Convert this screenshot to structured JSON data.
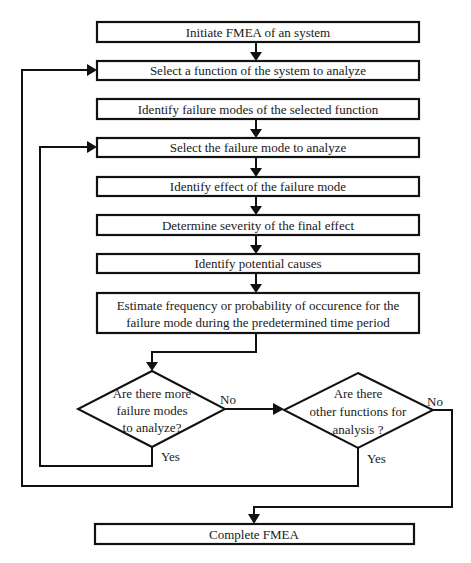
{
  "diagram": {
    "steps": [
      {
        "id": "initiate",
        "lines": [
          "Initiate FMEA of an system"
        ]
      },
      {
        "id": "select-function",
        "lines": [
          "Select a function of the system to analyze"
        ]
      },
      {
        "id": "identify-failure-modes",
        "lines": [
          "Identify failure modes of the selected function"
        ]
      },
      {
        "id": "select-failure-mode",
        "lines": [
          "Select the failure mode to analyze"
        ]
      },
      {
        "id": "identify-effect",
        "lines": [
          "Identify effect of the failure mode"
        ]
      },
      {
        "id": "determine-severity",
        "lines": [
          "Determine severity of the final effect"
        ]
      },
      {
        "id": "identify-causes",
        "lines": [
          "Identify potential causes"
        ]
      },
      {
        "id": "estimate-frequency",
        "lines": [
          "Estimate frequency or probability of occurence for the",
          "failure mode during the predetermined time period"
        ]
      }
    ],
    "decisions": [
      {
        "id": "more-failure-modes",
        "lines": [
          "Are there more",
          "failure modes",
          "to analyze?"
        ],
        "yes_label": "Yes",
        "no_label": "No"
      },
      {
        "id": "other-functions",
        "lines": [
          "Are there",
          "other functions for",
          "analysis ?"
        ],
        "yes_label": "Yes",
        "no_label": "No"
      }
    ],
    "end_step": {
      "id": "complete",
      "lines": [
        "Complete FMEA"
      ]
    },
    "edges": [
      {
        "from": "initiate",
        "to": "select-function"
      },
      {
        "from": "identify-failure-modes",
        "to": "select-failure-mode"
      },
      {
        "from": "select-failure-mode",
        "to": "identify-effect"
      },
      {
        "from": "identify-effect",
        "to": "determine-severity"
      },
      {
        "from": "determine-severity",
        "to": "identify-causes"
      },
      {
        "from": "identify-causes",
        "to": "estimate-frequency"
      },
      {
        "from": "estimate-frequency",
        "to": "more-failure-modes"
      },
      {
        "from": "more-failure-modes",
        "to": "select-failure-mode",
        "label": "Yes"
      },
      {
        "from": "more-failure-modes",
        "to": "other-functions",
        "label": "No"
      },
      {
        "from": "other-functions",
        "to": "select-function",
        "label": "Yes"
      },
      {
        "from": "other-functions",
        "to": "complete",
        "label": "No"
      }
    ]
  }
}
